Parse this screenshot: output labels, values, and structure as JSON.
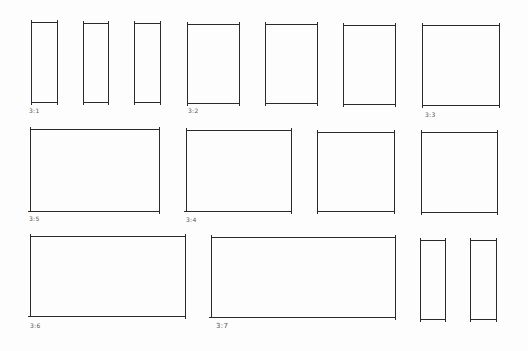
{
  "sheet": {
    "title": "Aspect ratio thumbnail sketches",
    "stroke_color": "#2a2a2a",
    "label_color": "#555555",
    "background": "#fdfdfd"
  },
  "frames": [
    {
      "id": "r1-1",
      "row": 1,
      "x": 31,
      "y": 22,
      "w": 27,
      "h": 81,
      "label": "3:1"
    },
    {
      "id": "r1-2",
      "row": 1,
      "x": 83,
      "y": 23,
      "w": 26,
      "h": 80,
      "label": ""
    },
    {
      "id": "r1-3",
      "row": 1,
      "x": 134,
      "y": 23,
      "w": 27,
      "h": 80,
      "label": ""
    },
    {
      "id": "r1-4",
      "row": 1,
      "x": 187,
      "y": 24,
      "w": 53,
      "h": 80,
      "label": "3:2"
    },
    {
      "id": "r1-5",
      "row": 1,
      "x": 265,
      "y": 24,
      "w": 53,
      "h": 80,
      "label": ""
    },
    {
      "id": "r1-6",
      "row": 1,
      "x": 343,
      "y": 25,
      "w": 53,
      "h": 80,
      "label": ""
    },
    {
      "id": "r1-7",
      "row": 1,
      "x": 422,
      "y": 25,
      "w": 78,
      "h": 81,
      "label": "3:3"
    },
    {
      "id": "r2-1",
      "row": 2,
      "x": 30,
      "y": 129,
      "w": 130,
      "h": 83,
      "label": "3:5"
    },
    {
      "id": "r2-2",
      "row": 2,
      "x": 186,
      "y": 130,
      "w": 106,
      "h": 82,
      "label": "3:4"
    },
    {
      "id": "r2-3",
      "row": 2,
      "x": 317,
      "y": 132,
      "w": 78,
      "h": 80,
      "label": ""
    },
    {
      "id": "r2-4",
      "row": 2,
      "x": 421,
      "y": 132,
      "w": 77,
      "h": 81,
      "label": ""
    },
    {
      "id": "r3-1",
      "row": 3,
      "x": 30,
      "y": 236,
      "w": 156,
      "h": 81,
      "label": "3:6"
    },
    {
      "id": "r3-2",
      "row": 3,
      "x": 211,
      "y": 237,
      "w": 185,
      "h": 81,
      "label": "3:7"
    },
    {
      "id": "r3-3",
      "row": 3,
      "x": 420,
      "y": 240,
      "w": 26,
      "h": 80,
      "label": ""
    },
    {
      "id": "r3-4",
      "row": 3,
      "x": 470,
      "y": 240,
      "w": 27,
      "h": 80,
      "label": ""
    }
  ]
}
